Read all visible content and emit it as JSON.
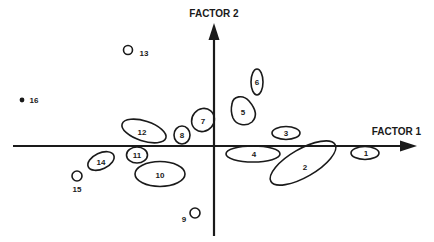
{
  "diagram": {
    "x_axis_label": "FACTOR 1",
    "y_axis_label": "FACTOR 2",
    "colors": {
      "ink": "#1a1a1a",
      "background": "#ffffff"
    },
    "items": [
      {
        "id": "1",
        "label": "1",
        "shape": "ellipse",
        "quadrant": "on-x-axis-right"
      },
      {
        "id": "2",
        "label": "2",
        "shape": "ellipse",
        "quadrant": "IV"
      },
      {
        "id": "3",
        "label": "3",
        "shape": "ellipse",
        "quadrant": "I"
      },
      {
        "id": "4",
        "label": "4",
        "shape": "ellipse",
        "quadrant": "IV"
      },
      {
        "id": "5",
        "label": "5",
        "shape": "ellipse",
        "quadrant": "I"
      },
      {
        "id": "6",
        "label": "6",
        "shape": "ellipse",
        "quadrant": "I"
      },
      {
        "id": "7",
        "label": "7",
        "shape": "ellipse",
        "quadrant": "II"
      },
      {
        "id": "8",
        "label": "8",
        "shape": "circle",
        "quadrant": "II"
      },
      {
        "id": "9",
        "label": "9",
        "shape": "small-circle",
        "quadrant": "III"
      },
      {
        "id": "10",
        "label": "10",
        "shape": "ellipse",
        "quadrant": "III"
      },
      {
        "id": "11",
        "label": "11",
        "shape": "ellipse",
        "quadrant": "III"
      },
      {
        "id": "12",
        "label": "12",
        "shape": "ellipse",
        "quadrant": "II"
      },
      {
        "id": "13",
        "label": "13",
        "shape": "small-circle",
        "quadrant": "II"
      },
      {
        "id": "14",
        "label": "14",
        "shape": "ellipse",
        "quadrant": "III"
      },
      {
        "id": "15",
        "label": "15",
        "shape": "small-circle",
        "quadrant": "III"
      },
      {
        "id": "16",
        "label": "16",
        "shape": "dot",
        "quadrant": "II"
      }
    ]
  }
}
